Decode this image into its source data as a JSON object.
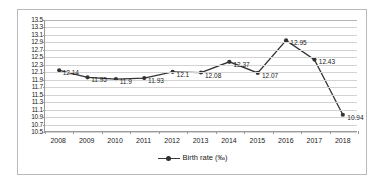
{
  "chart_data": {
    "type": "line",
    "title": "",
    "subtitle": "",
    "xlabel": "",
    "ylabel": "",
    "categories": [
      "2008",
      "2009",
      "2010",
      "2011",
      "2012",
      "2013",
      "2014",
      "2015",
      "2016",
      "2017",
      "2018"
    ],
    "series": [
      {
        "name": "Birth rate (‰)",
        "values": [
          12.14,
          11.95,
          11.9,
          11.93,
          12.1,
          12.08,
          12.37,
          12.07,
          12.95,
          12.43,
          10.94
        ],
        "color": "#333333",
        "marker": "circle"
      }
    ],
    "data_labels": [
      "12.14",
      "11.95",
      "11.9",
      "11.93",
      "12.1",
      "12.08",
      "12.37",
      "12.07",
      "12.95",
      "12.43",
      "10.94"
    ],
    "ylim": [
      10.5,
      13.5
    ],
    "ytick_step": 0.2,
    "yticks": [
      "13.5",
      "13.3",
      "13.1",
      "12.9",
      "12.7",
      "12.5",
      "12.3",
      "12.1",
      "11.9",
      "11.7",
      "11.5",
      "11.3",
      "11.1",
      "10.9",
      "10.7",
      "10.5"
    ],
    "grid": true,
    "grid_axis": "y",
    "legend": {
      "position": "bottom",
      "entries": [
        "Birth rate (‰)"
      ]
    }
  },
  "legend": {
    "label": "Birth rate (‰)"
  },
  "colors": {
    "series": "#333333",
    "gridline": "#d3d3d3",
    "axis": "#9a9a9a",
    "frame": "#b9b9b9",
    "text": "#1a1a1a"
  }
}
